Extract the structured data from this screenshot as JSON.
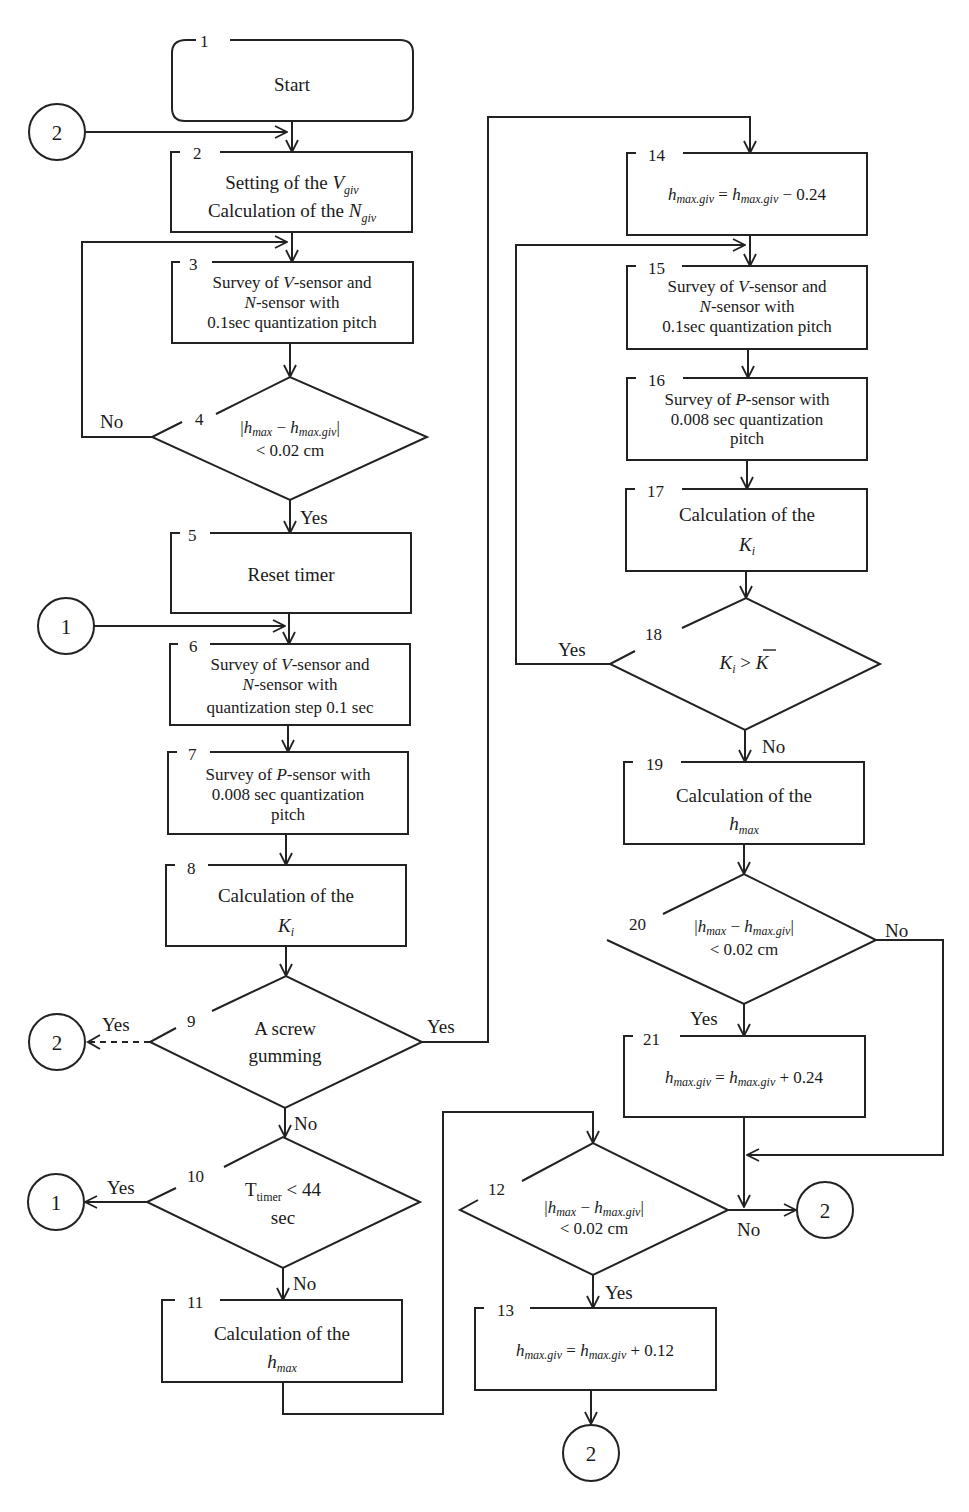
{
  "flowchart": {
    "blocks": [
      {
        "id": 1,
        "type": "terminal",
        "text": [
          "Start"
        ]
      },
      {
        "id": 2,
        "type": "process",
        "text": [
          "Setting of the V_giv",
          "Calculation of the N_giv"
        ]
      },
      {
        "id": 3,
        "type": "process",
        "text": [
          "Survey of V-sensor and",
          "N-sensor with",
          "0.1sec quantization pitch"
        ]
      },
      {
        "id": 4,
        "type": "decision",
        "text": [
          "|h_max − h_max.giv|",
          "< 0.02 cm"
        ],
        "yes": "5",
        "no": "3"
      },
      {
        "id": 5,
        "type": "process",
        "text": [
          "Reset timer"
        ]
      },
      {
        "id": 6,
        "type": "process",
        "text": [
          "Survey of V-sensor and",
          "N-sensor with",
          "quantization step 0.1 sec"
        ]
      },
      {
        "id": 7,
        "type": "process",
        "text": [
          "Survey of P-sensor with",
          "0.008 sec quantization",
          "pitch"
        ]
      },
      {
        "id": 8,
        "type": "process",
        "text": [
          "Calculation of the",
          "K_i"
        ]
      },
      {
        "id": 9,
        "type": "decision",
        "text": [
          "A screw",
          "gumming"
        ],
        "yes": "14 / connector 2",
        "no": "10"
      },
      {
        "id": 10,
        "type": "decision",
        "text": [
          "T_timer < 44",
          "sec"
        ],
        "yes": "connector 1",
        "no": "11"
      },
      {
        "id": 11,
        "type": "process",
        "text": [
          "Calculation of the",
          "h_max"
        ]
      },
      {
        "id": 12,
        "type": "decision",
        "text": [
          "|h_max − h_max.giv|",
          "< 0.02 cm"
        ],
        "yes": "13",
        "no": "connector 2"
      },
      {
        "id": 13,
        "type": "process",
        "text": [
          "h_max.giv = h_max.giv + 0.12"
        ]
      },
      {
        "id": 14,
        "type": "process",
        "text": [
          "h_max.giv = h_max.giv − 0.24"
        ]
      },
      {
        "id": 15,
        "type": "process",
        "text": [
          "Survey of V-sensor and",
          "N-sensor with",
          "0.1sec quantization pitch"
        ]
      },
      {
        "id": 16,
        "type": "process",
        "text": [
          "Survey of P-sensor with",
          "0.008 sec quantization",
          "pitch"
        ]
      },
      {
        "id": 17,
        "type": "process",
        "text": [
          "Calculation of the",
          "K_i"
        ]
      },
      {
        "id": 18,
        "type": "decision",
        "text": [
          "K_i > K̄"
        ],
        "yes": "15",
        "no": "19"
      },
      {
        "id": 19,
        "type": "process",
        "text": [
          "Calculation of the",
          "h_max"
        ]
      },
      {
        "id": 20,
        "type": "decision",
        "text": [
          "|h_max − h_max.giv|",
          "< 0.02 cm"
        ],
        "yes": "21",
        "no": "connector 2"
      },
      {
        "id": 21,
        "type": "process",
        "text": [
          "h_max.giv = h_max.giv + 0.24"
        ]
      }
    ],
    "labels": {
      "start": "Start",
      "yes": "Yes",
      "no": "No",
      "setting": "Setting of the ",
      "calc_of_the": "Calculation of the ",
      "calc_of_the_short": "Calculation of the",
      "V": "V",
      "N": "N",
      "giv": "giv",
      "survey_v": "Survey of ",
      "sensor_and": "-sensor and",
      "sensor_with": "-sensor with",
      "pitch_01": "0.1sec quantization pitch",
      "step_01": "quantization step 0.1 sec",
      "survey_p_with": "-sensor with",
      "p_pitch_line2": "0.008 sec quantization",
      "p_pitch_line3": "pitch",
      "P": "P",
      "K": "K",
      "i": "i",
      "h": "h",
      "max": "max",
      "maxgiv": "max.giv",
      "lt_002": "< 0.02 cm",
      "minus": " − ",
      "reset_timer": "Reset timer",
      "screw_1": "A screw",
      "screw_2": "gumming",
      "T": "T",
      "timer": "timer",
      "lt_44": " < 44",
      "sec": "sec",
      "eq": " = ",
      "minus_024": " − 0.24",
      "plus_024": " + 0.24",
      "plus_012": " + 0.12",
      "gt": " > "
    },
    "block_numbers": [
      "1",
      "2",
      "3",
      "4",
      "5",
      "6",
      "7",
      "8",
      "9",
      "10",
      "11",
      "12",
      "13",
      "14",
      "15",
      "16",
      "17",
      "18",
      "19",
      "20",
      "21"
    ],
    "connectors": [
      {
        "label": "2",
        "position": "top-left, feeds block 2"
      },
      {
        "label": "1",
        "position": "left, feeds block 6"
      },
      {
        "label": "2",
        "position": "left of block 9 (dashed)"
      },
      {
        "label": "1",
        "position": "left of block 10"
      },
      {
        "label": "2",
        "position": "right of block 12"
      },
      {
        "label": "2",
        "position": "below block 13"
      }
    ]
  }
}
